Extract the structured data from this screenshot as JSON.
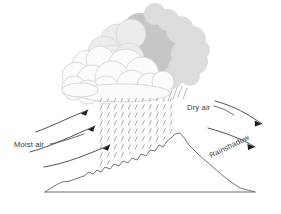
{
  "diagram": {
    "type": "schematic-cross-section",
    "background_color": "#ffffff",
    "line_color": "#5a5a5a",
    "labels": {
      "moist_air": "Moist air",
      "dry_air": "Dry air",
      "rainshadow": "Rainshadow"
    },
    "colors": {
      "cloud_dark": "#c6c6c6",
      "cloud_mid": "#d8d8d8",
      "cloud_light": "#ededed",
      "cloud_white": "#fafafa",
      "cloud_outline": "#c0c0c0",
      "rain": "#8e8e8e",
      "terrain_line": "#5f5f5f",
      "arrow": "#333333",
      "text": "#3a3a3a"
    },
    "elements": {
      "clouds_label": "cumulus cloud mass",
      "rain_label": "precipitation hatching",
      "mountain_label": "mountain cross-section",
      "ground_label": "ground baseline",
      "windward_arrows_label": "rising moist airflow arrows",
      "leeward_arrows_label": "descending dry airflow arrows"
    },
    "arrow_counts": {
      "windward": 3,
      "leeward": 2
    }
  }
}
